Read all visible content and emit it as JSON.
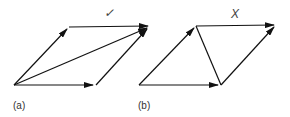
{
  "figure": {
    "panels": [
      {
        "label": "(a)",
        "mark": "✓",
        "description": "parallelogram with diagonal resultant from origin"
      },
      {
        "label": "(b)",
        "mark": "X",
        "description": "parallelogram with incorrect diagonal between other corners"
      }
    ]
  }
}
